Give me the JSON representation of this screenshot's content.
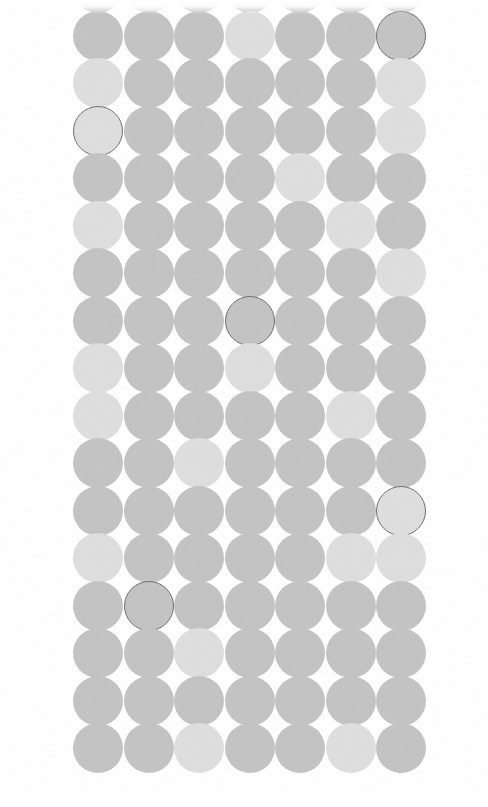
{
  "canvas": {
    "width": 488,
    "height": 807,
    "background": "#ffffff"
  },
  "pattern": {
    "name": "circle-dot-grid",
    "columns": 7,
    "rows": 17,
    "circle_diameter": 50,
    "column_spacing": 50.5,
    "row_spacing": 47.5,
    "first_column_center_x": 98,
    "first_row_center_y": -12,
    "clipped_top": true,
    "clipped_bottom": true,
    "tones": {
      "medium": "#c3c3c3",
      "light": "#dedede"
    },
    "marker_outline_color": "#6f6f74",
    "marker_outline_width": 1.2,
    "marked_count": 5,
    "marked_cells": [
      {
        "row": 1,
        "col": 7
      },
      {
        "row": 3,
        "col": 1
      },
      {
        "row": 7,
        "col": 4
      },
      {
        "row": 11,
        "col": 7
      },
      {
        "row": 13,
        "col": 2
      }
    ],
    "tone_map": [
      [
        "medium",
        "light",
        "medium",
        "medium",
        "medium",
        "medium",
        "medium"
      ],
      [
        "medium",
        "medium",
        "medium",
        "light",
        "medium",
        "medium",
        "medium"
      ],
      [
        "light",
        "medium",
        "medium",
        "medium",
        "medium",
        "medium",
        "light"
      ],
      [
        "light",
        "medium",
        "medium",
        "medium",
        "medium",
        "medium",
        "light"
      ],
      [
        "medium",
        "medium",
        "medium",
        "medium",
        "light",
        "medium",
        "medium"
      ],
      [
        "light",
        "medium",
        "medium",
        "medium",
        "medium",
        "light",
        "medium"
      ],
      [
        "medium",
        "medium",
        "medium",
        "medium",
        "medium",
        "medium",
        "light"
      ],
      [
        "medium",
        "medium",
        "medium",
        "medium",
        "medium",
        "medium",
        "medium"
      ],
      [
        "light",
        "medium",
        "medium",
        "light",
        "medium",
        "medium",
        "medium"
      ],
      [
        "light",
        "medium",
        "medium",
        "medium",
        "medium",
        "light",
        "medium"
      ],
      [
        "medium",
        "medium",
        "light",
        "medium",
        "medium",
        "medium",
        "medium"
      ],
      [
        "medium",
        "medium",
        "medium",
        "medium",
        "medium",
        "medium",
        "light"
      ],
      [
        "light",
        "medium",
        "medium",
        "medium",
        "medium",
        "light",
        "light"
      ],
      [
        "medium",
        "medium",
        "medium",
        "medium",
        "medium",
        "medium",
        "medium"
      ],
      [
        "medium",
        "medium",
        "light",
        "medium",
        "medium",
        "medium",
        "medium"
      ],
      [
        "medium",
        "medium",
        "medium",
        "medium",
        "medium",
        "medium",
        "medium"
      ],
      [
        "medium",
        "medium",
        "light",
        "medium",
        "medium",
        "light",
        "medium"
      ]
    ]
  }
}
